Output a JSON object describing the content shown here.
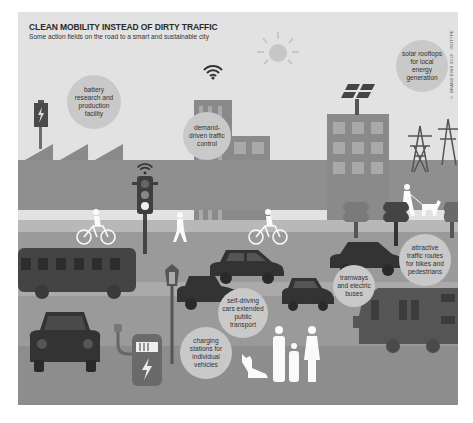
{
  "header": {
    "title": "CLEAN MOBILITY INSTEAD OF DIRTY TRAFFIC",
    "subtitle": "Some action fields on the road to a smart and sustainable city"
  },
  "credit": "© BRAND EINS 2018 · ISOTYPE",
  "bubbles": [
    {
      "id": "battery",
      "label": "battery research and production facility"
    },
    {
      "id": "demand",
      "label": "demand-driven traffic control"
    },
    {
      "id": "solar",
      "label": "solar rooftops for local energy generation"
    },
    {
      "id": "routes",
      "label": "attractive traffic routes for bikes and pedestrians"
    },
    {
      "id": "tram",
      "label": "tramways and electric buses"
    },
    {
      "id": "selfdriving",
      "label": "self-driving cars extended public transport"
    },
    {
      "id": "charging",
      "label": "charging stations for individual vehicles"
    }
  ],
  "icons": [
    "battery-icon",
    "wifi-icon",
    "sun-icon",
    "solar-panel-icon",
    "power-pylon-icon",
    "traffic-light-icon",
    "cyclist-icon",
    "pedestrian-icon",
    "dog-walker-icon",
    "tree-icon",
    "bus-icon",
    "car-icon",
    "street-lamp-icon",
    "charging-station-icon",
    "family-icon",
    "dog-icon",
    "tram-icon"
  ],
  "colors": {
    "panel": "#e2e2e2",
    "bubble": "#c9c9c9",
    "building": "#8a8a8a",
    "road": "#9a9a9a",
    "vehicle": "#3c3c3c"
  }
}
